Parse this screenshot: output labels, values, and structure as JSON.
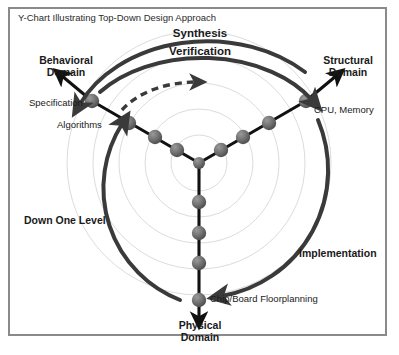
{
  "diagram": {
    "title": "Y-Chart Illustrating Top-Down Design Approach",
    "frame_color": "#8a8a8a",
    "axis_color": "#111111",
    "node_color": "#6e6e6e",
    "ring_color": "#d8d8d8",
    "arc_color": "#3a3a3a",
    "labels": {
      "top_phase_outer": "Synthesis",
      "top_phase_inner": "Verification",
      "behavioral_domain": "Behavioral\nDomain",
      "structural_domain": "Structural\nDomain",
      "physical_domain": "Physical\nDomain",
      "behavioral_item_1": "Specification",
      "behavioral_item_2": "Algorithms",
      "structural_item_1": "CPU, Memory",
      "physical_item_1": "Chip/Board Floorplanning",
      "left_arc": "Down One Level",
      "right_arc": "Implementation"
    }
  },
  "chart_data": {
    "type": "diagram",
    "title": "Y-Chart Illustrating Top-Down Design Approach",
    "center": {
      "x": 199,
      "y": 163
    },
    "axes": [
      {
        "name": "behavioral",
        "direction_deg": 210,
        "endpoint": {
          "x": 90,
          "y": 100
        },
        "arrow_tip": {
          "x": 58,
          "y": 72
        },
        "domain_label": "Behavioral Domain",
        "level_labels": [
          "Specification",
          "Algorithms"
        ],
        "nodes": [
          {
            "x": 92,
            "y": 101
          },
          {
            "x": 129,
            "y": 123
          },
          {
            "x": 155,
            "y": 137
          },
          {
            "x": 177,
            "y": 150
          },
          {
            "x": 199,
            "y": 163
          }
        ]
      },
      {
        "name": "structural",
        "direction_deg": 330,
        "endpoint": {
          "x": 308,
          "y": 101
        },
        "arrow_tip": {
          "x": 340,
          "y": 72
        },
        "domain_label": "Structural Domain",
        "level_labels": [
          "CPU, Memory"
        ],
        "nodes": [
          {
            "x": 306,
            "y": 101
          },
          {
            "x": 269,
            "y": 123
          },
          {
            "x": 243,
            "y": 137
          },
          {
            "x": 221,
            "y": 150
          },
          {
            "x": 199,
            "y": 163
          }
        ]
      },
      {
        "name": "physical",
        "direction_deg": 90,
        "endpoint": {
          "x": 199,
          "y": 300
        },
        "arrow_tip": {
          "x": 199,
          "y": 322
        },
        "domain_label": "Physical Domain",
        "level_labels": [
          "Chip/Board Floorplanning"
        ],
        "nodes": [
          {
            "x": 199,
            "y": 300
          },
          {
            "x": 199,
            "y": 263
          },
          {
            "x": 199,
            "y": 233
          },
          {
            "x": 199,
            "y": 202
          },
          {
            "x": 199,
            "y": 163
          }
        ]
      }
    ],
    "rings": [
      28,
      54,
      80,
      106,
      132
    ],
    "arcs": [
      {
        "name": "synthesis-arc",
        "label": "Synthesis",
        "style": "solid-thick",
        "from": "structural",
        "to": "behavioral"
      },
      {
        "name": "verification-arc",
        "label": "Verification",
        "style": "solid-thick",
        "from": "behavioral",
        "to": "structural"
      },
      {
        "name": "dashed-arc",
        "label": "",
        "style": "dashed",
        "from": "behavioral",
        "to": "structural"
      },
      {
        "name": "down-one-level-arc",
        "label": "Down One Level",
        "style": "solid-thick",
        "from": "physical",
        "to": "behavioral"
      },
      {
        "name": "implementation-arc",
        "label": "Implementation",
        "style": "solid-thick",
        "from": "structural",
        "to": "physical"
      }
    ]
  }
}
